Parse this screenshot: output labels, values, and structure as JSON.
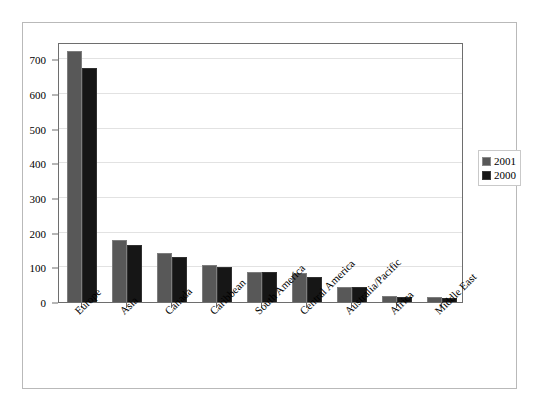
{
  "chart_data": {
    "type": "bar",
    "title": "",
    "xlabel": "",
    "ylabel": "",
    "ylim": [
      0,
      750
    ],
    "yticks": [
      0,
      100,
      200,
      300,
      400,
      500,
      600,
      700
    ],
    "grid": true,
    "legend_position": "right",
    "categories": [
      "Europe",
      "Asia",
      "Canada",
      "Caribbean",
      "South America",
      "Central America",
      "Australia/Pacific",
      "Africa",
      "Middle East"
    ],
    "series": [
      {
        "name": "2001",
        "color": "#585858",
        "values": [
          725,
          178,
          140,
          107,
          86,
          84,
          44,
          18,
          14
        ]
      },
      {
        "name": "2000",
        "color": "#161616",
        "values": [
          675,
          165,
          131,
          100,
          86,
          73,
          44,
          15,
          13
        ]
      }
    ]
  },
  "legend": {
    "entries": [
      {
        "label": "2001"
      },
      {
        "label": "2000"
      }
    ]
  }
}
